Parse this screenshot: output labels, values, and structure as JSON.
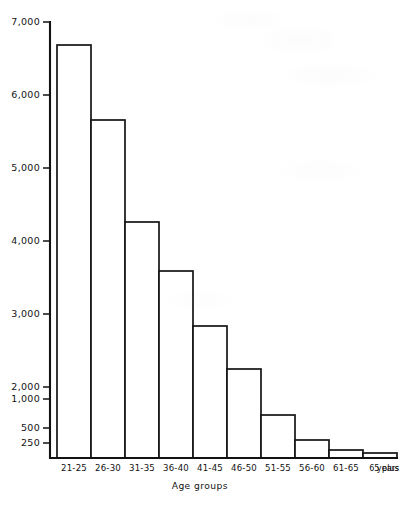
{
  "chart_data": {
    "type": "bar",
    "title": "",
    "subtitle": "",
    "xlabel": "Age groups",
    "ylabel": "",
    "unit_suffix": "years",
    "grid": false,
    "legend": null,
    "categories": [
      "21-25",
      "26-30",
      "31-35",
      "36-40",
      "41-45",
      "46-50",
      "51-55",
      "56-60",
      "61-65",
      "65 plus"
    ],
    "values": [
      6570,
      5330,
      3830,
      3050,
      2210,
      1530,
      730,
      440,
      200,
      120
    ],
    "ylim": [
      0,
      7000
    ],
    "yticks": [
      7000,
      6000,
      5000,
      4000,
      3000,
      2000,
      1000,
      500,
      250
    ],
    "ytick_labels": [
      "7,000",
      "6,000",
      "5,000",
      "4,000",
      "3,000",
      "2,000",
      "1,000",
      "500",
      "250"
    ],
    "y_axis_note": "compressed non-linear scale below 1,000",
    "colors": {
      "bar_fill": "#ffffff",
      "bar_stroke": "#151515",
      "axis": "#121212",
      "text": "#131313",
      "background": "#ffffff"
    }
  },
  "geometry": {
    "plot_left": 57,
    "plot_baseline": 458,
    "plot_top": 22,
    "bar_width": 34,
    "axis_x": 50,
    "tick_len": 7,
    "xlabel_y": 471,
    "axis_title_y": 489,
    "unit_x": 388,
    "ytick_pixels": [
      22,
      95,
      168,
      241,
      314,
      387,
      399,
      428,
      443
    ],
    "bar_top_pixels": [
      45,
      120,
      222,
      271,
      326,
      369,
      415,
      440,
      450,
      453
    ]
  }
}
